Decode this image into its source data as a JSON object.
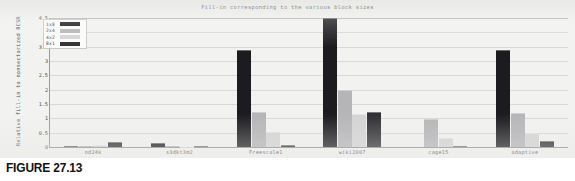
{
  "figure": {
    "caption": "FIGURE 27.13"
  },
  "chart_data": {
    "type": "bar",
    "title": "Fill-in corresponding to the various block sizes",
    "xlabel": "",
    "ylabel": "Relative fill-in to nonsectorized BCSR",
    "ylim": [
      0,
      4.5
    ],
    "yticks": [
      "0",
      "0.5",
      "1",
      "1.5",
      "2",
      "2.5",
      "3",
      "3.5",
      "4",
      "4.5"
    ],
    "ytick_values": [
      0,
      0.5,
      1,
      1.5,
      2,
      2.5,
      3,
      3.5,
      4,
      4.5
    ],
    "grid": true,
    "legend_position": "top-left",
    "categories": [
      "nd24k",
      "s3dkt3m2",
      "Freescale1",
      "wiki2007",
      "cage15",
      "adaptive"
    ],
    "series": [
      {
        "name": "1x8",
        "color": "#1b1b20",
        "values": [
          0.04,
          0.14,
          3.4,
          4.5,
          0.0,
          3.4
        ]
      },
      {
        "name": "2x4",
        "color": "#b5b5b8",
        "values": [
          0.02,
          0.02,
          1.23,
          2.0,
          0.97,
          1.2
        ]
      },
      {
        "name": "4x2",
        "color": "#d4d4d5",
        "values": [
          0.07,
          0.01,
          0.52,
          1.15,
          0.32,
          0.5
        ]
      },
      {
        "name": "8x1",
        "color": "#2e2e33",
        "values": [
          0.16,
          0.04,
          0.07,
          1.22,
          0.03,
          0.22
        ]
      }
    ]
  }
}
